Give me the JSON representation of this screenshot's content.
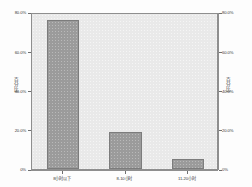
{
  "chart_data": {
    "type": "bar",
    "title": "",
    "subtitle": "",
    "xlabel": "",
    "ylabel": "百分比",
    "ylabel_right": "百分比",
    "categories": [
      "8小时以下",
      "8-10小时",
      "11-20小时"
    ],
    "values": [
      76,
      19,
      5
    ],
    "value_labels": [
      "76%",
      "19%",
      "5%"
    ],
    "ylim": [
      0,
      80
    ],
    "yticks": [
      0,
      20,
      40,
      60,
      80
    ],
    "ytick_labels": [
      "0%",
      "20.0%",
      "40.0%",
      "60.0%",
      "80.0%"
    ],
    "ytick_labels_right": [
      "0%",
      "20.0%",
      "40.0%",
      "60.0%",
      "80.0%"
    ],
    "grid": false,
    "legend": false,
    "legend_position": "none",
    "colors": {
      "bar_fill": "#9b9b9b",
      "bar_edge": "#7c7c7c",
      "plot_background": "#e9e9e9",
      "canvas_background": "#fdfdfd",
      "axis": "#8e8e8e",
      "text": "#3a3a3a"
    }
  }
}
